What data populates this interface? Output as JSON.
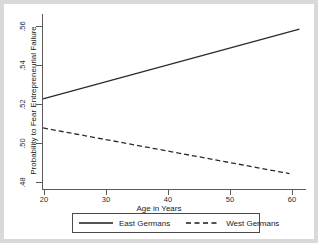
{
  "chart_data": {
    "type": "line",
    "title": "",
    "subtitle": "",
    "xlabel": "Age in Years",
    "ylabel": "Probability to Fear Entrepreneurial Failure",
    "xlim": [
      20,
      60
    ],
    "ylim": [
      0.47,
      0.568
    ],
    "grid": false,
    "legend_position": "bottom",
    "xticks": [
      20,
      30,
      40,
      50,
      60
    ],
    "xtick_labels": [
      "20",
      "30",
      "40",
      "50",
      "60"
    ],
    "yticks": [
      0.48,
      0.5,
      0.52,
      0.54,
      0.56
    ],
    "ytick_labels": [
      ".48",
      ".50",
      ".52",
      ".54",
      ".56"
    ],
    "series": [
      {
        "name": "East Germans",
        "style": "solid",
        "color": "#2b2b2b",
        "x": [
          20,
          59
        ],
        "values": [
          0.5205,
          0.5595
        ]
      },
      {
        "name": "West Germans",
        "style": "dashed",
        "color": "#2b2b2b",
        "x": [
          20,
          57.5
        ],
        "values": [
          0.5042,
          0.4786
        ]
      }
    ]
  },
  "axes": {
    "x_title": "Age in Years",
    "y_title": "Probability to Fear Entrepreneurial Failure",
    "x_labels": [
      "20",
      "30",
      "40",
      "50",
      "60"
    ],
    "y_labels": [
      ".48",
      ".50",
      ".52",
      ".54",
      ".56"
    ]
  },
  "legend": {
    "entries": [
      {
        "label": "East Germans",
        "style": "solid"
      },
      {
        "label": "West Germans",
        "style": "dashed"
      }
    ]
  }
}
